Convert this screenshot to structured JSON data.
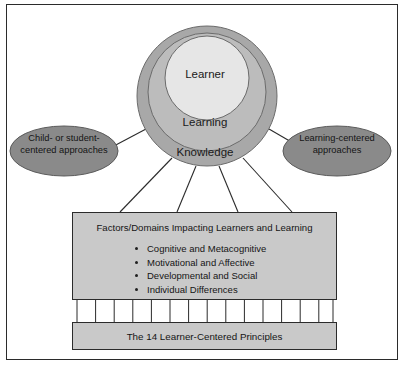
{
  "figure": {
    "border_color": "#2b2b2b",
    "background": "#ffffff"
  },
  "circles": {
    "outer": {
      "label": "Knowledge",
      "fill": "#a8a8a8",
      "stroke": "#6b6b6b"
    },
    "middle": {
      "label": "Learning",
      "fill": "#bcbcbc",
      "stroke": "#6b6b6b"
    },
    "inner": {
      "label": "Learner",
      "fill": "#e6e6e6",
      "stroke": "#6b6b6b"
    }
  },
  "ellipses": {
    "left": {
      "line1": "Child- or student-",
      "line2": "centered approaches",
      "fill": "#8a8a8a",
      "stroke": "#5a5a5a"
    },
    "right": {
      "line1": "Learning-centered",
      "line2": "approaches",
      "fill": "#8a8a8a",
      "stroke": "#5a5a5a"
    }
  },
  "factors_box": {
    "title": "Factors/Domains Impacting Learners and Learning",
    "fill": "#c9c9c9",
    "stroke": "#2b2b2b",
    "items": [
      "Cognitive and Metacognitive",
      "Motivational and Affective",
      "Developmental and Social",
      "Individual Differences"
    ]
  },
  "principles_box": {
    "label": "The 14 Learner-Centered Principles",
    "fill": "#c9c9c9",
    "stroke": "#2b2b2b",
    "connector_count": 15
  },
  "connectors": {
    "stroke": "#2b2b2b",
    "circle_to_factors_count": 4,
    "circle_to_ellipse_count": 2
  }
}
